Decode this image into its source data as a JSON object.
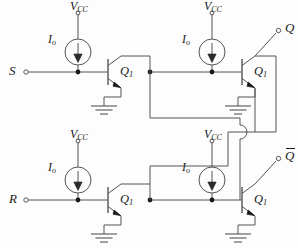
{
  "figure": {
    "kind": "circuit-schematic",
    "background_color": "#fdfdfd",
    "wire_color": "#555555",
    "text_color": "#1a1a1a"
  },
  "labels": {
    "supply": "V",
    "supply_sub": "CC",
    "current_source": "I",
    "current_source_sub": "o",
    "transistor": "Q",
    "transistor_sub": "1",
    "input_set": "S",
    "input_reset": "R",
    "output_q": "Q",
    "output_qbar": "Q"
  },
  "terminals": [
    {
      "name": "set-input",
      "label": "S",
      "x": 18,
      "y": 72,
      "side": "left",
      "overline": false
    },
    {
      "name": "reset-input",
      "label": "R",
      "x": 18,
      "y": 200,
      "side": "left",
      "overline": false
    },
    {
      "name": "q-output",
      "label": "Q",
      "x": 283,
      "y": 29,
      "side": "right",
      "overline": false
    },
    {
      "name": "qbar-output",
      "label": "Q",
      "x": 283,
      "y": 157,
      "side": "right",
      "overline": true
    }
  ],
  "stages": [
    {
      "name": "stage-set-left",
      "transistor_label": "Q",
      "transistor_sub": "1",
      "current_source_label": "I",
      "current_source_sub": "o",
      "supply_label": "V",
      "supply_sub": "CC",
      "base_x": 78,
      "base_y": 72
    },
    {
      "name": "stage-q-right",
      "transistor_label": "Q",
      "transistor_sub": "1",
      "current_source_label": "I",
      "current_source_sub": "o",
      "supply_label": "V",
      "supply_sub": "CC",
      "base_x": 212,
      "base_y": 72
    },
    {
      "name": "stage-reset-left",
      "transistor_label": "Q",
      "transistor_sub": "1",
      "current_source_label": "I",
      "current_source_sub": "o",
      "supply_label": "V",
      "supply_sub": "CC",
      "base_x": 78,
      "base_y": 200
    },
    {
      "name": "stage-qbar-right",
      "transistor_label": "Q",
      "transistor_sub": "1",
      "current_source_label": "I",
      "current_source_sub": "o",
      "supply_label": "V",
      "supply_sub": "CC",
      "base_x": 212,
      "base_y": 200
    }
  ],
  "annotations": {
    "wire_hop": "wire-crossing-hop",
    "junction_dots": 8,
    "ground_symbols": 4,
    "current_sources": 4,
    "transistors": 4
  }
}
